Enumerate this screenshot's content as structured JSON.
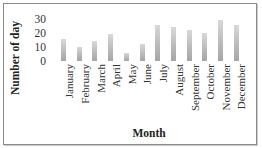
{
  "chart_data": {
    "type": "bar",
    "title": "",
    "xlabel": "Month",
    "ylabel": "Number of day",
    "categories": [
      "January",
      "February",
      "March",
      "April",
      "May",
      "June",
      "July",
      "August",
      "September",
      "October",
      "November",
      "December"
    ],
    "values": [
      16,
      10,
      14,
      19,
      6,
      12,
      26,
      24,
      22,
      20,
      29,
      26
    ],
    "yticks": [
      "30",
      "20",
      "10",
      "0"
    ],
    "ylim": [
      0,
      30
    ],
    "grid": false,
    "legend": "none",
    "bar_color": "#b8b8b8"
  }
}
